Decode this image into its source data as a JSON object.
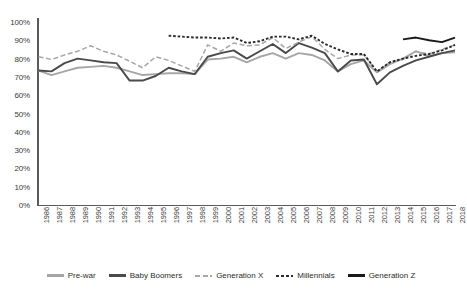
{
  "chart_data": {
    "type": "line",
    "title": "",
    "subtitle": "",
    "xlabel": "",
    "ylabel": "",
    "ylim": [
      0,
      100
    ],
    "ytick_labels": [
      "100%",
      "90%",
      "80%",
      "70%",
      "60%",
      "50%",
      "40%",
      "30%",
      "20%",
      "10%",
      "0%"
    ],
    "ytick_values": [
      100,
      90,
      80,
      70,
      60,
      50,
      40,
      30,
      20,
      10,
      0
    ],
    "grid": false,
    "legend_position": "bottom",
    "x": [
      1986,
      1987,
      1988,
      1989,
      1990,
      1991,
      1992,
      1993,
      1994,
      1995,
      1996,
      1997,
      1998,
      1999,
      2000,
      2001,
      2002,
      2003,
      2004,
      2005,
      2006,
      2007,
      2008,
      2009,
      2010,
      2011,
      2012,
      2013,
      2014,
      2015,
      2016,
      2017,
      2018
    ],
    "categories": [
      "1986",
      "1987",
      "1988",
      "1989",
      "1990",
      "1991",
      "1992",
      "1993",
      "1994",
      "1995",
      "1996",
      "1997",
      "1998",
      "1999",
      "2000",
      "2001",
      "2002",
      "2003",
      "2004",
      "2005",
      "2006",
      "2007",
      "2008",
      "2009",
      "2010",
      "2011",
      "2012",
      "2013",
      "2014",
      "2015",
      "2016",
      "2017",
      "2018"
    ],
    "series": [
      {
        "name": "Pre-war",
        "color": "#a6a6a6",
        "style": "solid",
        "start_index": 0,
        "values": [
          73.5,
          71,
          73,
          75,
          75.5,
          76,
          75,
          73,
          71,
          71.5,
          72,
          72,
          71.5,
          79.5,
          80,
          81,
          78,
          81,
          83,
          80,
          83,
          82,
          79,
          73,
          77,
          79,
          72.5,
          77,
          80,
          84,
          81.5,
          83,
          83.5
        ]
      },
      {
        "name": "Baby Boomers",
        "color": "#4a4a4a",
        "style": "solid",
        "start_index": 0,
        "values": [
          73.5,
          73,
          77.5,
          80,
          79,
          78,
          77.5,
          68,
          68,
          70.5,
          75,
          73,
          71.5,
          81,
          83,
          84.5,
          80,
          84,
          88,
          83,
          88.5,
          86,
          83,
          73,
          79,
          79.5,
          66,
          72.5,
          76,
          79,
          81,
          83,
          84.5
        ]
      },
      {
        "name": "Generation X",
        "color": "#a6a6a6",
        "style": "dashed-long",
        "start_index": 0,
        "values": [
          81,
          79.5,
          82,
          84,
          87,
          84,
          82,
          78.5,
          75,
          81,
          79,
          76,
          73,
          87.5,
          84,
          88.5,
          87,
          87.5,
          91.5,
          85.5,
          89,
          92,
          85,
          80,
          82,
          82,
          73,
          78,
          79.5,
          84,
          82.5,
          85,
          87.5
        ]
      },
      {
        "name": "Millennials",
        "color": "#2b2b2b",
        "style": "dashed-short",
        "start_index": 10,
        "values": [
          null,
          null,
          null,
          null,
          null,
          null,
          null,
          null,
          null,
          null,
          92.5,
          92,
          91.5,
          91.5,
          91,
          91.5,
          88.5,
          89.5,
          92,
          92,
          90.5,
          92.5,
          88,
          85,
          82.5,
          82.5,
          73,
          78,
          80,
          81.5,
          82.5,
          84.5,
          87.5
        ]
      },
      {
        "name": "Generation Z",
        "color": "#1a1a1a",
        "style": "solid",
        "start_index": 28,
        "values": [
          null,
          null,
          null,
          null,
          null,
          null,
          null,
          null,
          null,
          null,
          null,
          null,
          null,
          null,
          null,
          null,
          null,
          null,
          null,
          null,
          null,
          null,
          null,
          null,
          null,
          null,
          null,
          null,
          90.5,
          91.5,
          90,
          89,
          91.5
        ]
      }
    ],
    "legend": [
      {
        "label": "Pre-war",
        "color": "#a6a6a6",
        "style": "solid"
      },
      {
        "label": "Baby Boomers",
        "color": "#4a4a4a",
        "style": "solid"
      },
      {
        "label": "Generation X",
        "color": "#a6a6a6",
        "style": "dashed-long"
      },
      {
        "label": "Millennials",
        "color": "#2b2b2b",
        "style": "dashed-short"
      },
      {
        "label": "Generation Z",
        "color": "#1a1a1a",
        "style": "solid"
      }
    ]
  }
}
